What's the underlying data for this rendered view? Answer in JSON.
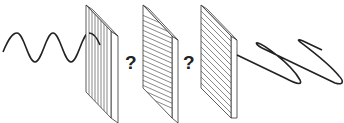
{
  "diagram": {
    "colors": {
      "stroke": "#222222",
      "plate_fill": "#ffffff",
      "hatch": "#555555"
    },
    "incoming_wave": {
      "type": "sine",
      "label": ""
    },
    "polarizers": [
      {
        "id": 1,
        "orientation": "vertical"
      },
      {
        "id": 2,
        "orientation": "diagonal"
      },
      {
        "id": 3,
        "orientation": "diagonal"
      }
    ],
    "question_marks": [
      "?",
      "?"
    ],
    "outgoing_wave": {
      "type": "helical/zigzag"
    }
  }
}
